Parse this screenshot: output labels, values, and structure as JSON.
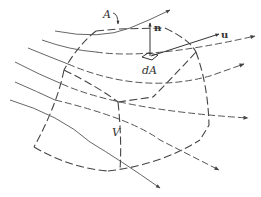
{
  "figure": {
    "type": "control-volume-diagram",
    "labels": {
      "surface": "A",
      "area_element": "dA",
      "normal": "n",
      "velocity": "u",
      "volume": "V"
    },
    "colors": {
      "background": "#ffffff",
      "stroke": "#555555",
      "text": "#333333"
    },
    "streamline_count": 6
  }
}
